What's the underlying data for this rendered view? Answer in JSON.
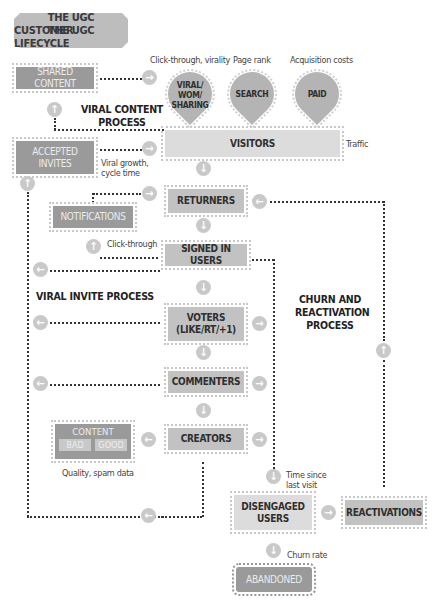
{
  "title": "THE UGC CUSTOMER LIFECYCLE",
  "title_lines": [
    "THE UGC",
    "CUSTOMER LIFECYCLE"
  ],
  "sources": {
    "viral": {
      "label": "VIRAL/ WOM/ SHARING",
      "metric": "Click-through, virality"
    },
    "search": {
      "label": "SEARCH",
      "metric": "Page rank"
    },
    "paid": {
      "label": "PAID",
      "metric": "Acquisition costs"
    }
  },
  "sections": {
    "viral_content": "VIRAL CONTENT PROCESS",
    "viral_invite": "VIRAL INVITE PROCESS",
    "churn": "CHURN AND REACTIVATION PROCESS"
  },
  "nodes": {
    "shared_content": "SHARED CONTENT",
    "accepted_invites": "ACCEPTED INVITES",
    "notifications": "NOTIFICATIONS",
    "visitors": "VISITORS",
    "returners": "RETURNERS",
    "signed_in": "SIGNED IN USERS",
    "voters": "VOTERS (LIKE/RT/+1)",
    "commenters": "COMMENTERS",
    "creators": "CREATORS",
    "content": "CONTENT",
    "content_bad": "BAD",
    "content_good": "GOOD",
    "disengaged": "DISENGAGED USERS",
    "reactivations": "REACTIVATIONS",
    "abandoned": "ABANDONED"
  },
  "metrics": {
    "traffic": "Traffic",
    "viral_growth": "Viral growth, cycle time",
    "click_through": "Click-through",
    "quality": "Quality, spam data",
    "time_since": "Time since last visit",
    "churn_rate": "Churn rate"
  },
  "icons": {
    "right": "→",
    "left": "←",
    "up": "↑",
    "down": "↓"
  }
}
